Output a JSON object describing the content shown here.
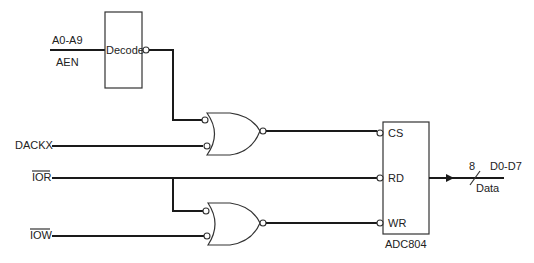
{
  "diagram": {
    "type": "logic-circuit",
    "inputs": [
      {
        "id": "addr",
        "label_top": "A0-A9",
        "label_bottom": "AEN"
      },
      {
        "id": "dackx",
        "label": "DACKX",
        "overline": false
      },
      {
        "id": "ior",
        "label": "IOR",
        "overline": true
      },
      {
        "id": "iow",
        "label": "IOW",
        "overline": true
      }
    ],
    "decoder": {
      "label": "Decode",
      "output_inverted": true
    },
    "gates": [
      {
        "id": "gate1",
        "type": "OR-with-inverted-inputs-and-output",
        "inputs": [
          "decode_out",
          "DACKX"
        ],
        "output": "CS"
      },
      {
        "id": "gate2",
        "type": "OR-with-inverted-inputs-and-output",
        "inputs": [
          "IOR",
          "IOW"
        ],
        "output": "WR"
      }
    ],
    "chip": {
      "name": "ADC804",
      "pins": [
        {
          "label": "CS",
          "inverted": true
        },
        {
          "label": "RD",
          "inverted": true
        },
        {
          "label": "WR",
          "inverted": true
        }
      ]
    },
    "output_bus": {
      "width": "8",
      "name": "D0-D7",
      "label": "Data"
    }
  }
}
